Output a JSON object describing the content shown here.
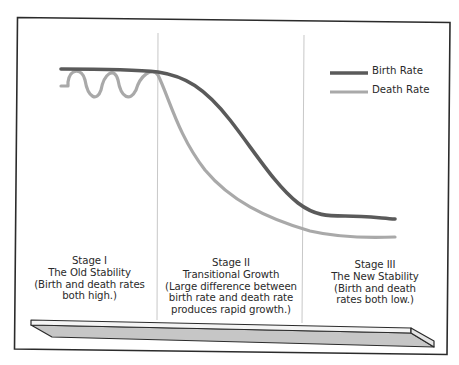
{
  "diagram": {
    "type": "demographic-transition",
    "legend": [
      {
        "label": "Birth Rate",
        "color": "#5a5a5a"
      },
      {
        "label": "Death Rate",
        "color": "#a9a9a9"
      }
    ],
    "stages": [
      {
        "lines": [
          "Stage I",
          "The Old Stability",
          "(Birth and death rates",
          "both high.)"
        ]
      },
      {
        "lines": [
          "Stage II",
          "Transitional Growth",
          "(Large difference between",
          "birth rate and death rate",
          "produces rapid growth.)"
        ]
      },
      {
        "lines": [
          "Stage III",
          "The New Stability",
          "(Birth and death",
          "rates both low.)"
        ]
      }
    ],
    "colors": {
      "frame": "#2b2b2b",
      "divider": "#c8c8c8",
      "birth_rate": "#5a5a5a",
      "death_rate": "#a9a9a9",
      "timeline_fill": "#c6c6c6",
      "timeline_top": "#f4f4f4"
    }
  }
}
